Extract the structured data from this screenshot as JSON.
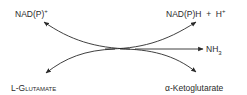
{
  "diagram": {
    "type": "reaction-scheme",
    "reactants": [
      {
        "id": "nadp-ox",
        "text": "NAD(P)",
        "sup": "+"
      },
      {
        "id": "glutamate",
        "text": "L-Glutamate"
      }
    ],
    "products": [
      {
        "id": "nadph",
        "text": "NAD(P)H + H",
        "sup": "+"
      },
      {
        "id": "nh3",
        "text": "NH",
        "sub": "3"
      },
      {
        "id": "ketoglutarate",
        "text": "α-Ketoglutarate"
      }
    ],
    "labels": {
      "nadp": "NAD(P)",
      "nadp_sup": "+",
      "nadph": "NAD(P)H  +  H",
      "nadph_sup": "+",
      "nh3": "NH",
      "nh3_sub": "3",
      "glutamate": "L-Glutamate",
      "ketoglutarate": "α-Ketoglutarate"
    },
    "colors": {
      "ink": "#2a2a2a",
      "background": "#ffffff"
    }
  }
}
